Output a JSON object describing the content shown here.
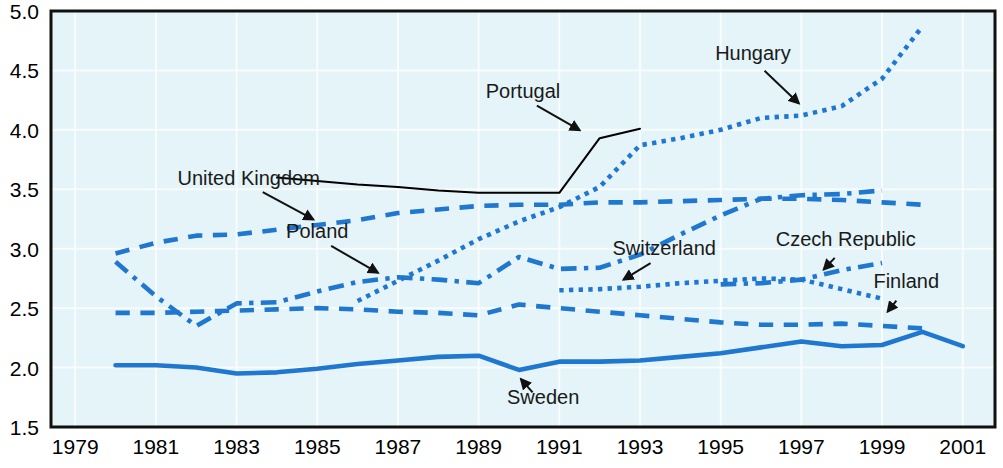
{
  "chart_data": {
    "type": "line",
    "title": "",
    "xlabel": "",
    "ylabel": "",
    "xlim": [
      1978.4,
      2001.8
    ],
    "ylim": [
      1.5,
      5.0
    ],
    "yticks": [
      1.5,
      2.0,
      2.5,
      3.0,
      3.5,
      4.0,
      4.5,
      5.0
    ],
    "ytick_labels": [
      "1.5",
      "2.0",
      "2.5",
      "3.0",
      "3.5",
      "4.0",
      "4.5",
      "5.0"
    ],
    "xticks": [
      1979,
      1981,
      1983,
      1985,
      1987,
      1989,
      1991,
      1993,
      1995,
      1997,
      1999,
      2001
    ],
    "xtick_labels": [
      "1979",
      "1981",
      "1983",
      "1985",
      "1987",
      "1989",
      "1991",
      "1993",
      "1995",
      "1997",
      "1999",
      "2001"
    ],
    "grid": true,
    "legend": "annotations",
    "plot_background": "#e4f4f8",
    "accent_color": "#1f77d0",
    "series": [
      {
        "name": "Hungary",
        "style": "dotted",
        "color": "#1f77d0",
        "x": [
          1986,
          1987,
          1988,
          1989,
          1990,
          1991,
          1992,
          1993,
          1994,
          1995,
          1996,
          1997,
          1998,
          1999,
          2000
        ],
        "values": [
          2.56,
          2.73,
          2.9,
          3.08,
          3.23,
          3.35,
          3.52,
          3.87,
          3.93,
          4.0,
          4.1,
          4.12,
          4.2,
          4.43,
          4.87
        ]
      },
      {
        "name": "Portugal",
        "style": "solid",
        "color": "#000000",
        "x": [
          1984,
          1985,
          1986,
          1987,
          1988,
          1989,
          1990,
          1991,
          1992,
          1993
        ],
        "values": [
          3.6,
          3.57,
          3.54,
          3.52,
          3.49,
          3.47,
          3.47,
          3.47,
          3.93,
          4.01
        ]
      },
      {
        "name": "United Kingdom",
        "style": "dashed",
        "color": "#1f77d0",
        "x": [
          1980,
          1981,
          1982,
          1983,
          1984,
          1985,
          1986,
          1987,
          1988,
          1989,
          1990,
          1991,
          1992,
          1993,
          1994,
          1995,
          1996,
          1997,
          1998,
          1999,
          2000
        ],
        "values": [
          2.96,
          3.05,
          3.11,
          3.12,
          3.16,
          3.2,
          3.24,
          3.3,
          3.33,
          3.36,
          3.37,
          3.37,
          3.39,
          3.39,
          3.4,
          3.41,
          3.42,
          3.42,
          3.41,
          3.39,
          3.37
        ]
      },
      {
        "name": "Poland",
        "style": "dashdot",
        "color": "#1f77d0",
        "x": [
          1980,
          1981,
          1982,
          1983,
          1984,
          1985,
          1986,
          1987,
          1988,
          1989,
          1990,
          1991,
          1992,
          1993,
          1994,
          1995,
          1996,
          1997,
          1998,
          1999
        ],
        "values": [
          2.89,
          2.6,
          2.35,
          2.54,
          2.55,
          2.64,
          2.72,
          2.76,
          2.74,
          2.71,
          2.93,
          2.83,
          2.84,
          2.95,
          3.12,
          3.28,
          3.42,
          3.45,
          3.46,
          3.49
        ]
      },
      {
        "name": "Finland",
        "style": "dashed",
        "color": "#1f77d0",
        "x": [
          1980,
          1981,
          1982,
          1983,
          1984,
          1985,
          1986,
          1987,
          1988,
          1989,
          1990,
          1991,
          1992,
          1993,
          1994,
          1995,
          1996,
          1997,
          1998,
          1999,
          2000
        ],
        "values": [
          2.46,
          2.46,
          2.47,
          2.48,
          2.49,
          2.5,
          2.49,
          2.47,
          2.46,
          2.44,
          2.53,
          2.5,
          2.47,
          2.44,
          2.41,
          2.38,
          2.36,
          2.36,
          2.37,
          2.35,
          2.33
        ]
      },
      {
        "name": "Switzerland",
        "style": "dotted",
        "color": "#1f77d0",
        "x": [
          1991,
          1992,
          1993,
          1994,
          1995,
          1996,
          1997,
          1998,
          1999
        ],
        "values": [
          2.65,
          2.66,
          2.68,
          2.71,
          2.73,
          2.75,
          2.74,
          2.66,
          2.58
        ]
      },
      {
        "name": "Czech Republic",
        "style": "dashdot",
        "color": "#1f77d0",
        "x": [
          1995,
          1996,
          1997,
          1998,
          1999
        ],
        "values": [
          2.7,
          2.71,
          2.74,
          2.82,
          2.88
        ]
      },
      {
        "name": "Sweden",
        "style": "solid",
        "color": "#1f77d0",
        "x": [
          1980,
          1981,
          1982,
          1983,
          1984,
          1985,
          1986,
          1987,
          1988,
          1989,
          1990,
          1991,
          1992,
          1993,
          1994,
          1995,
          1996,
          1997,
          1998,
          1999,
          2000,
          2001
        ],
        "values": [
          2.02,
          2.02,
          2.0,
          1.95,
          1.96,
          1.99,
          2.03,
          2.06,
          2.09,
          2.1,
          1.98,
          2.05,
          2.05,
          2.06,
          2.09,
          2.12,
          2.17,
          2.22,
          2.18,
          2.19,
          2.3,
          2.18
        ]
      }
    ],
    "annotations": [
      {
        "label": "United Kingdom",
        "label_x": 1983.3,
        "label_y": 3.54,
        "tip_x": 1985.1,
        "tip_y": 3.21
      },
      {
        "label": "Poland",
        "label_x": 1985.0,
        "label_y": 3.09,
        "tip_x": 1986.7,
        "tip_y": 2.76
      },
      {
        "label": "Portugal",
        "label_x": 1990.1,
        "label_y": 4.27,
        "tip_x": 1991.7,
        "tip_y": 3.96
      },
      {
        "label": "Hungary",
        "label_x": 1995.8,
        "label_y": 4.59,
        "tip_x": 1997.1,
        "tip_y": 4.17
      },
      {
        "label": "Switzerland",
        "label_x": 1993.6,
        "label_y": 2.95,
        "tip_x": 1992.4,
        "tip_y": 2.7
      },
      {
        "label": "Czech Republic",
        "label_x": 1998.1,
        "label_y": 3.02,
        "tip_x": 1997.4,
        "tip_y": 2.77
      },
      {
        "label": "Finland",
        "label_x": 1999.6,
        "label_y": 2.67,
        "tip_x": 1999.0,
        "tip_y": 2.41
      },
      {
        "label": "Sweden",
        "label_x": 1990.6,
        "label_y": 1.69,
        "tip_x": 1989.9,
        "tip_y": 1.96
      }
    ]
  }
}
